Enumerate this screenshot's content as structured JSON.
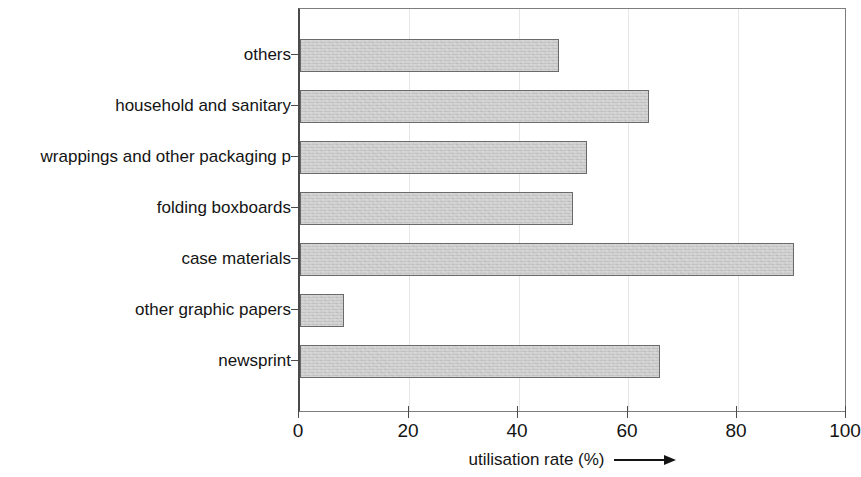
{
  "chart_data": {
    "type": "bar",
    "orientation": "horizontal",
    "title": "",
    "xlabel": "utilisation rate (%)",
    "ylabel": "",
    "xlim": [
      0,
      100
    ],
    "xticks": [
      0,
      20,
      40,
      60,
      80,
      100
    ],
    "xtick_labels": [
      "0",
      "20",
      "40",
      "60",
      "80",
      "100"
    ],
    "grid": true,
    "grid_axis": "x",
    "legend": false,
    "categories": [
      "others",
      "household and sanitary",
      "wrappings and other packaging p",
      "folding boxboards",
      "case materials",
      "other graphic papers",
      "newsprint"
    ],
    "values": [
      47.5,
      64,
      52.5,
      50,
      90.5,
      8,
      66
    ],
    "bar_color": "#c9c9c9",
    "bar_edge_color": "#6a6a6a",
    "axis_color": "#4a4a4a"
  },
  "axis_title": {
    "text": "utilisation rate (%)",
    "arrow": "right-arrow"
  }
}
